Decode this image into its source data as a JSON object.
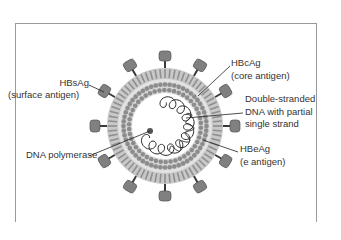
{
  "diagram": {
    "colors": {
      "spike_head": "#808080",
      "spike_stem": "#3a3a3a",
      "membrane": "#b0b0b0",
      "core_beads": "#8c8c8c",
      "dna_strand": "#2a2a2a",
      "frame": "#9a9a9a",
      "label_text": "#333333"
    },
    "labels": {
      "hbsag": {
        "line1": "HBsAg",
        "line2": "(surface antigen)"
      },
      "hbcag": {
        "line1": "HBcAg",
        "line2": "(core antigen)"
      },
      "dna": {
        "line1": "Double-stranded",
        "line2": "DNA with partial",
        "line3": "single strand"
      },
      "hbeag": {
        "line1": "HBeAg",
        "line2": "(e antigen)"
      },
      "polymerase": {
        "line1": "DNA polymerase"
      }
    }
  }
}
